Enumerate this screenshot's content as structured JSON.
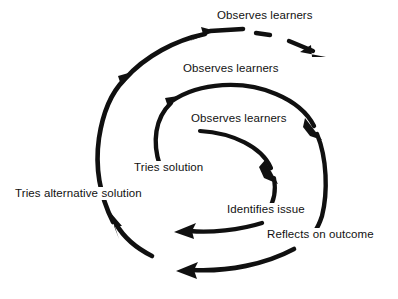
{
  "diagram": {
    "type": "spiral-cycle",
    "stroke_color": "#101010",
    "background_color": "#ffffff",
    "labels": {
      "observes_outer": "Observes learners",
      "observes_middle": "Observes learners",
      "observes_inner": "Observes learners",
      "tries_solution": "Tries solution",
      "tries_alternative_solution": "Tries alternative solution",
      "identifies_issue": "Identifies issue",
      "reflects_on_outcome": "Reflects on outcome"
    },
    "arms": [
      {
        "name": "inner-arm",
        "from_label": "Observes learners",
        "to_label": "Identifies issue",
        "direction": "clockwise"
      },
      {
        "name": "middle-arm",
        "from_label": "Tries solution",
        "to_label": "Reflects on outcome",
        "direction": "clockwise"
      },
      {
        "name": "outer-arm",
        "from_label": "Tries alternative solution",
        "to_label": "Observes learners",
        "direction": "clockwise"
      },
      {
        "name": "continuation-arm",
        "from_label": "Observes learners",
        "to_label": "",
        "direction": "outward",
        "style": "dashed"
      }
    ]
  }
}
